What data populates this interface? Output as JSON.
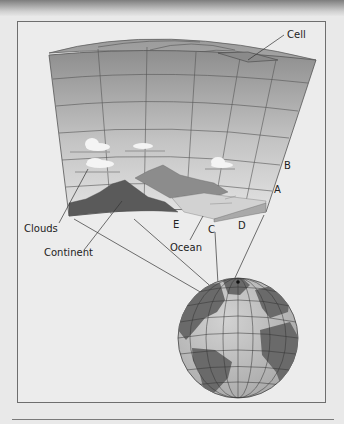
{
  "figure": {
    "type": "climate-model-grid-diagram",
    "labels": {
      "cell": "Cell",
      "clouds": "Clouds",
      "continent": "Continent",
      "ocean": "Ocean",
      "a": "A",
      "b": "B",
      "c": "C",
      "d": "D",
      "e": "E"
    },
    "colors": {
      "background": "#e9e9e9",
      "frame_border": "#6e6e6e",
      "grid_top": "#8a8a8a",
      "grid_bottom": "#e2e2e2",
      "continent_dark": "#5a5a5a",
      "continent_light": "#8c8c8c",
      "ocean": "#cfcfcf",
      "globe_land": "#6a6a6a",
      "globe_ocean": "#bdbdbd"
    }
  }
}
